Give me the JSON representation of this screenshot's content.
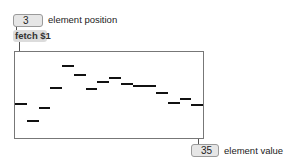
{
  "input": {
    "position_value": "3",
    "position_label": "element position"
  },
  "message": {
    "label": "fetch $1"
  },
  "multislider": {
    "range": [
      0,
      100
    ],
    "element_count": 16,
    "colors": {
      "border": "#777777",
      "bar": "#111111",
      "background": "#ffffff"
    }
  },
  "output": {
    "value": "35",
    "label": "element value"
  },
  "chart_data": {
    "type": "bar",
    "title": "",
    "xlabel": "",
    "ylabel": "",
    "categories": [
      "1",
      "2",
      "3",
      "4",
      "5",
      "6",
      "7",
      "8",
      "9",
      "10",
      "11",
      "12",
      "13",
      "14",
      "15",
      "16"
    ],
    "values": [
      40,
      20,
      35,
      58,
      84,
      73,
      57,
      65,
      70,
      63,
      60,
      60,
      52,
      41,
      45,
      38
    ],
    "ylim": [
      0,
      100
    ],
    "grid": false
  }
}
